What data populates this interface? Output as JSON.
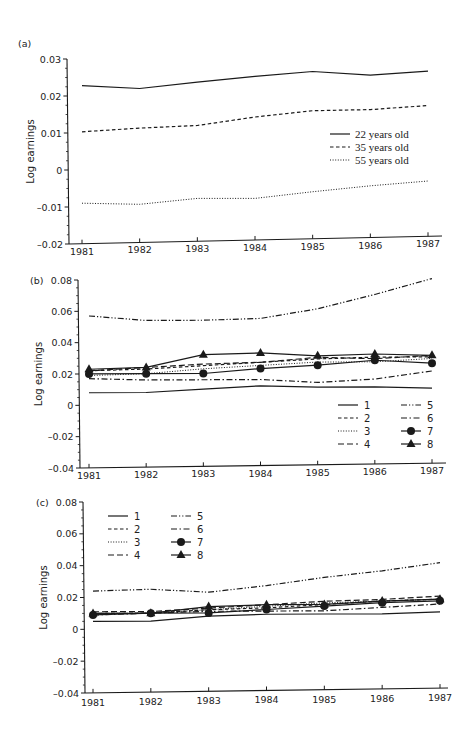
{
  "figure": {
    "panels": [
      "(a)",
      "(b)",
      "(c)"
    ]
  },
  "chart_data": [
    {
      "id": "a",
      "panel_label": "(a)",
      "type": "line",
      "title": "",
      "xlabel": "",
      "ylabel": "Log earnings",
      "x": [
        1981,
        1982,
        1983,
        1984,
        1985,
        1986,
        1987
      ],
      "x_tick_labels": [
        "1981",
        "1982",
        "1983",
        "1984",
        "1985",
        "1986",
        "1987"
      ],
      "y_ticks": [
        0.03,
        0.02,
        0.01,
        0,
        -0.01,
        -0.02
      ],
      "y_tick_labels": [
        "0.03",
        "0.02",
        "0.01",
        "0",
        "–0.01",
        "–0.02"
      ],
      "ylim": [
        -0.02,
        0.03
      ],
      "grid": false,
      "legend_position": "center-right",
      "series": [
        {
          "name": "22 years old",
          "style": "solid",
          "marker": "none",
          "values": [
            0.0228,
            0.0219,
            0.0235,
            0.025,
            0.0262,
            0.0251,
            0.0261
          ]
        },
        {
          "name": "35 years old",
          "style": "dashed",
          "marker": "none",
          "values": [
            0.0103,
            0.0112,
            0.0118,
            0.014,
            0.0156,
            0.0158,
            0.0168
          ]
        },
        {
          "name": "55 years old",
          "style": "dotted",
          "marker": "none",
          "values": [
            -0.009,
            -0.0094,
            -0.0079,
            -0.008,
            -0.0063,
            -0.0048,
            -0.0036
          ]
        }
      ]
    },
    {
      "id": "b",
      "panel_label": "(b)",
      "type": "line",
      "title": "",
      "xlabel": "",
      "ylabel": "Log earnings",
      "x": [
        1981,
        1982,
        1983,
        1984,
        1985,
        1986,
        1987
      ],
      "x_tick_labels": [
        "1981",
        "1982",
        "1983",
        "1984",
        "1985",
        "1986",
        "1987"
      ],
      "y_ticks": [
        0.08,
        0.06,
        0.04,
        0.02,
        0,
        -0.02,
        -0.04
      ],
      "y_tick_labels": [
        "0.08",
        "0.06",
        "0.04",
        "0.02",
        "0",
        "–0.02",
        "–0.04"
      ],
      "ylim": [
        -0.04,
        0.08
      ],
      "grid": false,
      "legend_position": "lower-right",
      "series": [
        {
          "name": "1",
          "style": "solid",
          "marker": "none",
          "values": [
            0.008,
            0.008,
            0.01,
            0.012,
            0.011,
            0.011,
            0.01
          ]
        },
        {
          "name": "2",
          "style": "dashed",
          "marker": "none",
          "values": [
            0.022,
            0.023,
            0.025,
            0.027,
            0.029,
            0.03,
            0.03
          ]
        },
        {
          "name": "3",
          "style": "dotted",
          "marker": "none",
          "values": [
            0.019,
            0.02,
            0.023,
            0.025,
            0.027,
            0.027,
            0.029
          ]
        },
        {
          "name": "4",
          "style": "longdash",
          "marker": "none",
          "values": [
            0.022,
            0.024,
            0.026,
            0.027,
            0.03,
            0.029,
            0.031
          ]
        },
        {
          "name": "5",
          "style": "dashdotdot",
          "marker": "none",
          "values": [
            0.057,
            0.054,
            0.054,
            0.055,
            0.061,
            0.07,
            0.08
          ]
        },
        {
          "name": "6",
          "style": "dashdot",
          "marker": "none",
          "values": [
            0.017,
            0.016,
            0.016,
            0.016,
            0.014,
            0.016,
            0.021
          ]
        },
        {
          "name": "7",
          "style": "solid",
          "marker": "circle",
          "values": [
            0.02,
            0.02,
            0.02,
            0.023,
            0.025,
            0.028,
            0.026
          ]
        },
        {
          "name": "8",
          "style": "solid",
          "marker": "triangle",
          "values": [
            0.023,
            0.024,
            0.032,
            0.033,
            0.031,
            0.032,
            0.031
          ]
        }
      ]
    },
    {
      "id": "c",
      "panel_label": "(c)",
      "type": "line",
      "title": "",
      "xlabel": "",
      "ylabel": "Log earnings",
      "x": [
        1981,
        1982,
        1983,
        1984,
        1985,
        1986,
        1987
      ],
      "x_tick_labels": [
        "1981",
        "1982",
        "1983",
        "1984",
        "1985",
        "1986",
        "1987"
      ],
      "y_ticks": [
        0.08,
        0.06,
        0.04,
        0.02,
        0,
        -0.02,
        -0.04
      ],
      "y_tick_labels": [
        "0.08",
        "0.06",
        "0.04",
        "0.02",
        "0",
        "–0.02",
        "–0.04"
      ],
      "ylim": [
        -0.04,
        0.08
      ],
      "grid": false,
      "legend_position": "upper-left",
      "series": [
        {
          "name": "1",
          "style": "solid",
          "marker": "none",
          "values": [
            0.005,
            0.005,
            0.008,
            0.009,
            0.009,
            0.009,
            0.01
          ]
        },
        {
          "name": "2",
          "style": "dashed",
          "marker": "none",
          "values": [
            0.01,
            0.01,
            0.012,
            0.013,
            0.015,
            0.017,
            0.018
          ]
        },
        {
          "name": "3",
          "style": "dotted",
          "marker": "none",
          "values": [
            0.01,
            0.01,
            0.012,
            0.014,
            0.016,
            0.017,
            0.018
          ]
        },
        {
          "name": "4",
          "style": "longdash",
          "marker": "none",
          "values": [
            0.011,
            0.011,
            0.013,
            0.015,
            0.017,
            0.018,
            0.02
          ]
        },
        {
          "name": "5",
          "style": "dashdotdot",
          "marker": "none",
          "values": [
            0.024,
            0.025,
            0.023,
            0.027,
            0.032,
            0.036,
            0.041
          ]
        },
        {
          "name": "6",
          "style": "dashdot",
          "marker": "none",
          "values": [
            0.009,
            0.01,
            0.011,
            0.011,
            0.011,
            0.013,
            0.015
          ]
        },
        {
          "name": "7",
          "style": "solid",
          "marker": "circle",
          "values": [
            0.009,
            0.01,
            0.01,
            0.012,
            0.014,
            0.016,
            0.017
          ]
        },
        {
          "name": "8",
          "style": "solid",
          "marker": "triangle",
          "values": [
            0.01,
            0.01,
            0.014,
            0.015,
            0.015,
            0.017,
            0.018
          ]
        }
      ]
    }
  ],
  "colors": {
    "line": "#1a1a1a",
    "background": "#ffffff"
  }
}
